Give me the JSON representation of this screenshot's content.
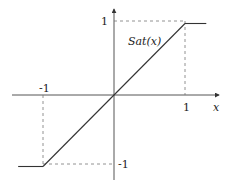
{
  "diagram": {
    "function_label": "Sat(x)",
    "x_axis_label": "x",
    "ticks": {
      "x_pos": "1",
      "x_neg": "-1",
      "y_pos": "1",
      "y_neg": "-1"
    },
    "function": {
      "type": "saturation",
      "breakpoints": [
        [
          -1,
          -1
        ],
        [
          1,
          1
        ]
      ],
      "lower_level": -1,
      "upper_level": 1
    }
  },
  "chart_data": {
    "type": "line",
    "title": "",
    "xlabel": "x",
    "ylabel": "",
    "series": [
      {
        "name": "Sat(x)",
        "x": [
          -1.35,
          -1,
          0,
          1,
          1.3
        ],
        "y": [
          -1,
          -1,
          0,
          1,
          1
        ]
      }
    ],
    "xlim": [
      -1.45,
      1.45
    ],
    "ylim": [
      -1.2,
      1.25
    ],
    "xticks": [
      "-1",
      "1"
    ],
    "yticks": [
      "-1",
      "1"
    ],
    "guides": "dashed projections from (1,1) and (-1,-1) to both axes",
    "grid": false,
    "legend": "none"
  }
}
